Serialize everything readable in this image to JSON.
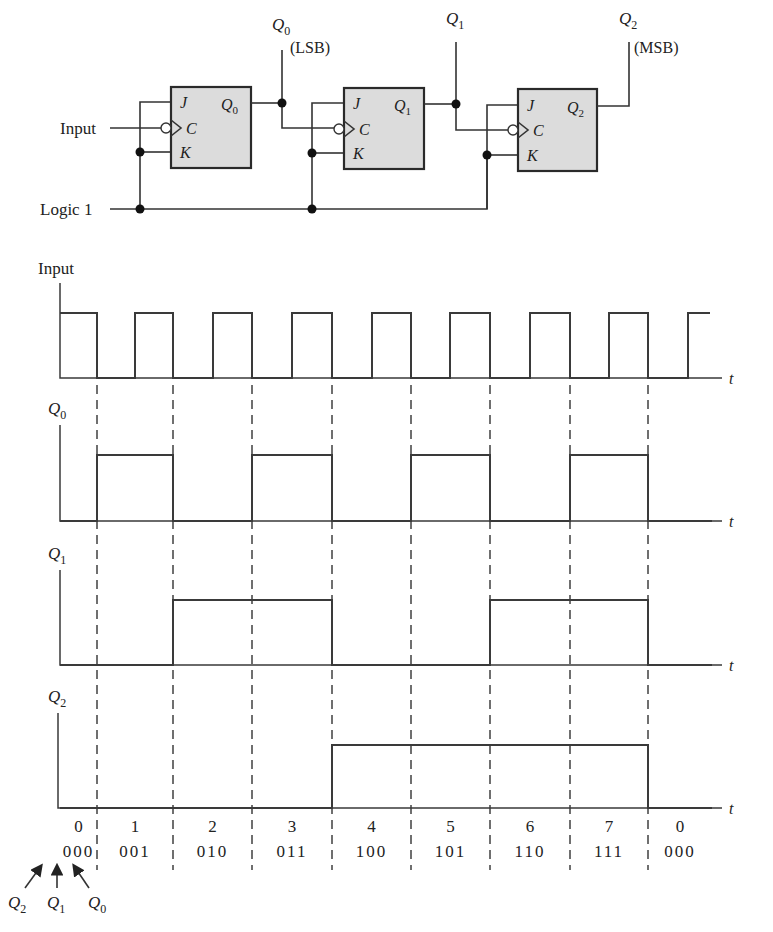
{
  "circuit": {
    "input_label": "Input",
    "logic1_label": "Logic 1",
    "flip_flops": [
      {
        "pins": {
          "j": "J",
          "c": "C",
          "k": "K"
        },
        "output": "Q",
        "sub": "0"
      },
      {
        "pins": {
          "j": "J",
          "c": "C",
          "k": "K"
        },
        "output": "Q",
        "sub": "1"
      },
      {
        "pins": {
          "j": "J",
          "c": "C",
          "k": "K"
        },
        "output": "Q",
        "sub": "2"
      }
    ],
    "outputs": [
      {
        "name": "Q",
        "sub": "0",
        "note": "(LSB)"
      },
      {
        "name": "Q",
        "sub": "1",
        "note": ""
      },
      {
        "name": "Q",
        "sub": "2",
        "note": "(MSB)"
      }
    ]
  },
  "timing": {
    "time_label": "t",
    "signals": [
      {
        "name": "Input",
        "sub": "",
        "levels": [
          1,
          0,
          1,
          0,
          1,
          0,
          1,
          0,
          1,
          0,
          1,
          0,
          1,
          0,
          1,
          0,
          1
        ]
      },
      {
        "name": "Q",
        "sub": "0",
        "levels": [
          0,
          1,
          0,
          1,
          0,
          1,
          0,
          1,
          0
        ]
      },
      {
        "name": "Q",
        "sub": "1",
        "levels": [
          0,
          0,
          1,
          1,
          0,
          0,
          1,
          1,
          0
        ]
      },
      {
        "name": "Q",
        "sub": "2",
        "levels": [
          0,
          0,
          0,
          0,
          1,
          1,
          1,
          1,
          0
        ]
      }
    ],
    "states": [
      {
        "decimal": "0",
        "binary": "000"
      },
      {
        "decimal": "1",
        "binary": "001"
      },
      {
        "decimal": "2",
        "binary": "010"
      },
      {
        "decimal": "3",
        "binary": "011"
      },
      {
        "decimal": "4",
        "binary": "100"
      },
      {
        "decimal": "5",
        "binary": "101"
      },
      {
        "decimal": "6",
        "binary": "110"
      },
      {
        "decimal": "7",
        "binary": "111"
      },
      {
        "decimal": "0",
        "binary": "000"
      }
    ],
    "bit_legend": [
      {
        "name": "Q",
        "sub": "2"
      },
      {
        "name": "Q",
        "sub": "1"
      },
      {
        "name": "Q",
        "sub": "0"
      }
    ]
  }
}
